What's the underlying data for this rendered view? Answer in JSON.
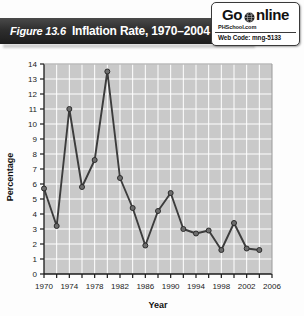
{
  "figure": {
    "number_label": "Figure 13.6",
    "title": "Inflation Rate, 1970–2004"
  },
  "badge": {
    "go_label": "Go",
    "online_label": "nline",
    "globe_icon": "globe-icon",
    "site_label": "PHSchool.com",
    "web_code_label": "Web Code: mng-5133"
  },
  "colors": {
    "title_band": "#2e2e2e",
    "plot_background": "#c9c9c9",
    "gridline": "#ffffff",
    "series_line": "#3c3c3c",
    "marker_fill": "#6e6e6e",
    "marker_stroke": "#2b2b2b",
    "axis": "#1a1a1a",
    "page_background": "#fdfdfd"
  },
  "chart_data": {
    "type": "line",
    "title": "Inflation Rate, 1970–2004",
    "xlabel": "Year",
    "ylabel": "Percentage",
    "xlim": [
      1970,
      2006
    ],
    "ylim": [
      0,
      14
    ],
    "ytick_step": 1,
    "yticks": [
      0,
      1,
      2,
      3,
      4,
      5,
      6,
      7,
      8,
      9,
      10,
      11,
      12,
      13,
      14
    ],
    "xticks": [
      1970,
      1972,
      1974,
      1976,
      1978,
      1980,
      1982,
      1984,
      1986,
      1988,
      1990,
      1992,
      1994,
      1996,
      1998,
      2000,
      2002,
      2004,
      2006
    ],
    "xtick_labels": [
      "1970",
      "",
      "1974",
      "",
      "1978",
      "",
      "1982",
      "",
      "1986",
      "",
      "1990",
      "",
      "1994",
      "",
      "1998",
      "",
      "2002",
      "",
      "2006"
    ],
    "grid": true,
    "legend": false,
    "markers": true,
    "x": [
      1970,
      1972,
      1974,
      1976,
      1978,
      1980,
      1982,
      1984,
      1986,
      1988,
      1990,
      1992,
      1994,
      1996,
      1998,
      2000,
      2002,
      2004
    ],
    "values": [
      5.7,
      3.2,
      11.0,
      5.8,
      7.6,
      13.5,
      6.4,
      4.4,
      1.9,
      4.2,
      5.4,
      3.0,
      2.7,
      2.9,
      1.6,
      3.4,
      1.7,
      1.6
    ],
    "series": [
      {
        "name": "Inflation Rate",
        "values": [
          5.7,
          3.2,
          11.0,
          5.8,
          7.6,
          13.5,
          6.4,
          4.4,
          1.9,
          4.2,
          5.4,
          3.0,
          2.7,
          2.9,
          1.6,
          3.4,
          1.7,
          1.6
        ]
      }
    ]
  }
}
